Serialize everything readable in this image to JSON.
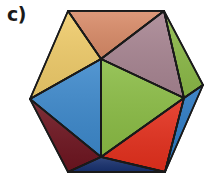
{
  "figure": {
    "label": "c)",
    "shape": "icosahedron"
  },
  "vertices": {
    "A": [
      68,
      11
    ],
    "B": [
      164,
      11
    ],
    "C": [
      101,
      59
    ],
    "D": [
      30,
      99
    ],
    "E": [
      203,
      85
    ],
    "F": [
      184,
      98
    ],
    "G": [
      101,
      157
    ],
    "H": [
      68,
      172
    ],
    "I": [
      165,
      172
    ]
  },
  "faces": [
    {
      "name": "face-top-orange",
      "points": "68,11 164,11 101,59",
      "color": "#d98b68"
    },
    {
      "name": "face-top-left-yellow",
      "points": "68,11 101,59 30,99",
      "color": "#f0cc6a"
    },
    {
      "name": "face-top-right-mauve",
      "points": "164,11 101,59 184,98",
      "color": "#a88592"
    },
    {
      "name": "face-right-green",
      "points": "164,11 203,85 184,98",
      "color": "#8cba48"
    },
    {
      "name": "face-left-blue",
      "points": "30,99 101,59 101,157",
      "color": "#3d89cc"
    },
    {
      "name": "face-center-green",
      "points": "101,59 184,98 101,157",
      "color": "#8bbd45"
    },
    {
      "name": "face-bottom-left-maroon",
      "points": "30,99 101,157 68,172",
      "color": "#6e1520"
    },
    {
      "name": "face-bottom-red",
      "points": "101,157 184,98 165,172",
      "color": "#e5301d"
    },
    {
      "name": "face-right-blue",
      "points": "184,98 203,85 165,172",
      "color": "#2a78c2"
    },
    {
      "name": "face-bottom-navy",
      "points": "68,172 101,157 165,172",
      "color": "#17306e"
    }
  ],
  "edge_color": "#1a1a1a"
}
